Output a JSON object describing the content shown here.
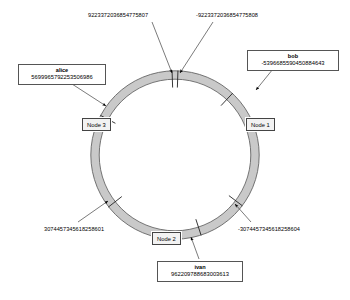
{
  "diagram": {
    "background_color": "#ffffff",
    "ring": {
      "center_x": 175,
      "center_y": 155,
      "outer_radius": 80,
      "inner_radius": 72,
      "band_fill": "#c9c9c9",
      "band_stroke": "#5a5a5a"
    }
  },
  "boundary_labels": [
    {
      "id": "int64-max",
      "text": "9223372036854775807",
      "x": 88,
      "y": 12
    },
    {
      "id": "int64-min",
      "text": "-9223372036854775808",
      "x": 196,
      "y": 12
    },
    {
      "id": "third-positive",
      "text": "3074457345618258601",
      "x": 44,
      "y": 226
    },
    {
      "id": "third-negative",
      "text": "-3074457345618258604",
      "x": 238,
      "y": 226
    }
  ],
  "key_labels": [
    {
      "id": "alice",
      "name": "alice",
      "value": "5699965792253506986",
      "x": 18,
      "y": 64,
      "width": 88
    },
    {
      "id": "bob",
      "name": "bob",
      "value": "-5396685590450884643",
      "x": 247,
      "y": 50,
      "width": 92
    },
    {
      "id": "ivan",
      "name": "ivan",
      "value": "962209788683003613",
      "x": 157,
      "y": 261,
      "width": 86
    }
  ],
  "nodes": [
    {
      "id": "node-3",
      "label": "Node 3",
      "x": 82,
      "y": 118
    },
    {
      "id": "node-1",
      "label": "Node 1",
      "x": 246,
      "y": 118
    },
    {
      "id": "node-2",
      "label": "Node 2",
      "x": 152,
      "y": 232
    }
  ],
  "connectors": [
    {
      "id": "connector-int64-max",
      "x1": 152,
      "y1": 22,
      "x2": 172,
      "y2": 73
    },
    {
      "id": "connector-int64-min",
      "x1": 213,
      "y1": 22,
      "x2": 180,
      "y2": 73
    },
    {
      "id": "connector-alice",
      "x1": 72,
      "y1": 84,
      "x2": 106,
      "y2": 106
    },
    {
      "id": "connector-bob",
      "x1": 277,
      "y1": 64,
      "x2": 256,
      "y2": 90
    },
    {
      "id": "connector-third-pos",
      "x1": 78,
      "y1": 222,
      "x2": 108,
      "y2": 201
    },
    {
      "id": "connector-third-neg",
      "x1": 251,
      "y1": 222,
      "x2": 235,
      "y2": 204
    },
    {
      "id": "connector-ivan",
      "x1": 199,
      "y1": 259,
      "x2": 191,
      "y2": 237
    }
  ],
  "ring_ticks": [
    {
      "id": "tick-top-left",
      "angle_deg": -92
    },
    {
      "id": "tick-top-right",
      "angle_deg": -88
    },
    {
      "id": "tick-alice",
      "angle_deg": -152
    },
    {
      "id": "tick-bob",
      "angle_deg": -47
    },
    {
      "id": "tick-third-pos",
      "angle_deg": 142
    },
    {
      "id": "tick-third-neg",
      "angle_deg": 37
    },
    {
      "id": "tick-ivan",
      "angle_deg": 72
    }
  ]
}
